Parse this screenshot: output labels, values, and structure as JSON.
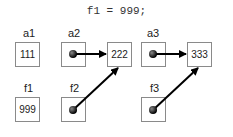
{
  "code_line": "f1 = 999;",
  "variables": {
    "a1": {
      "label": "a1",
      "value": "111"
    },
    "a2": {
      "label": "a2",
      "value": ""
    },
    "a2_target": {
      "value": "222"
    },
    "a3": {
      "label": "a3",
      "value": ""
    },
    "a3_target": {
      "value": "333"
    },
    "f1": {
      "label": "f1",
      "value": "999"
    },
    "f2": {
      "label": "f2",
      "value": ""
    },
    "f3": {
      "label": "f3",
      "value": ""
    }
  }
}
